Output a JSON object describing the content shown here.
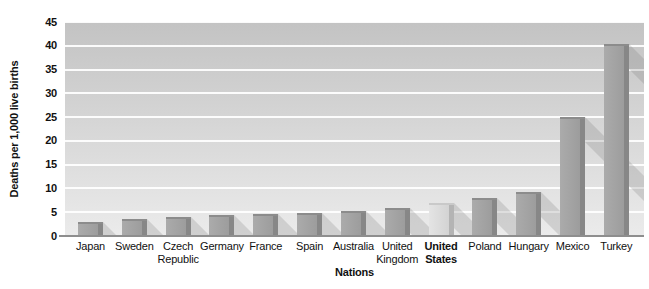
{
  "chart_data": {
    "type": "bar",
    "categories": [
      "Japan",
      "Sweden",
      "Czech Republic",
      "Germany",
      "France",
      "Spain",
      "Australia",
      "United Kingdom",
      "United States",
      "Poland",
      "Hungary",
      "Mexico",
      "Turkey"
    ],
    "values": [
      3,
      3.5,
      4.1,
      4.5,
      4.6,
      4.8,
      5.3,
      5.8,
      7,
      8,
      9.3,
      25,
      40.3
    ],
    "xlabel": "Nations",
    "ylabel": "Deaths per 1,000 live births",
    "ylim": [
      0,
      45
    ],
    "yticks": [
      0,
      5,
      10,
      15,
      20,
      25,
      30,
      35,
      40,
      45
    ],
    "grid": "horizontal-white-lines",
    "legend": "none",
    "highlighted_category": "United States",
    "style": "3d-bars-with-diagonal-shadows",
    "colors": {
      "bar_face": "#9e9e9e",
      "bar_side": "#878787",
      "highlight_face": "#d9d9d9",
      "highlight_side": "#b4b4b4",
      "plot_bg_top": "#c3c3c3",
      "plot_bg_bottom": "#ebebeb",
      "gridline": "#ffffff",
      "baseline": "#8e8e8e",
      "shadow": "rgba(115,115,115,0.22)",
      "text": "#111111"
    }
  }
}
